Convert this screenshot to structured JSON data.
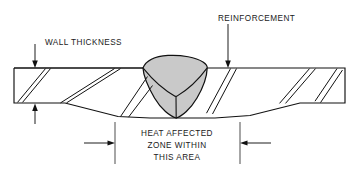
{
  "diagram": {
    "background_color": "#ffffff",
    "line_color": "#111111",
    "weld_fill_color": "#c9c9c9"
  },
  "labels": {
    "wall_thickness": "WALL THICKNESS",
    "reinforcement": "REINFORCEMENT",
    "heat_affected_line1": "HEAT AFFECTED",
    "heat_affected_line2": "ZONE WITHIN",
    "heat_affected_line3": "THIS AREA"
  },
  "annotations": {
    "wall_thickness_leader": "down-arrow-to-top-surface",
    "wall_thickness_lower_arrow": "up-arrow-to-bottom-surface",
    "reinforcement_leader": "down-arrow-to-weld-crown",
    "haz_left_arrow": "right-pointing-arrow",
    "haz_right_arrow": "left-pointing-arrow"
  },
  "geometry": {
    "plate_left_edge_x": 14,
    "plate_right_edge_x": 345,
    "plate_top_y": 68,
    "plate_left_bottom_y": 103,
    "valley_bottom_y": 118,
    "weld_crown_peak_y": 57,
    "weld_left_toe_x": 143,
    "weld_right_toe_x": 207,
    "weld_root_x": 176,
    "weld_root_y": 118,
    "haz_left_extension_x": 115,
    "haz_right_extension_x": 240
  }
}
